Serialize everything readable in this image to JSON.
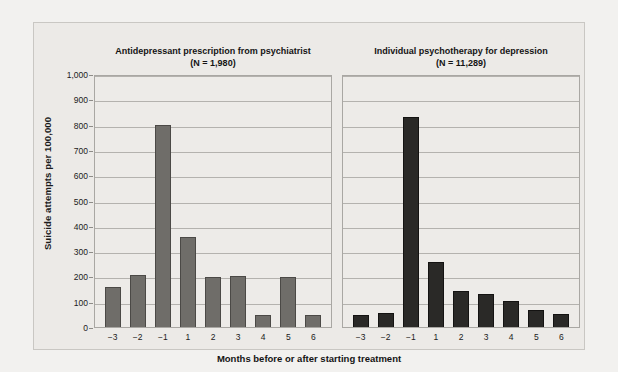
{
  "figure": {
    "y_axis_title": "Suicide attempts per 100,000",
    "x_axis_title": "Months before or after starting treatment"
  },
  "chart_data": [
    {
      "type": "bar",
      "title": "Antidepressant prescription from psychiatrist",
      "subtitle": "(N = 1,980)",
      "xlabel": "Months before or after starting treatment",
      "ylabel": "Suicide attempts per 100,000",
      "ylim": [
        0,
        1000
      ],
      "yticks": [
        "0",
        "100",
        "200",
        "300",
        "400",
        "500",
        "600",
        "700",
        "800",
        "900",
        "1,000"
      ],
      "grid": true,
      "legend": "none",
      "bar_color": "#6f6d69",
      "categories": [
        "−3",
        "−2",
        "−1",
        "1",
        "2",
        "3",
        "4",
        "5",
        "6"
      ],
      "values": [
        155,
        200,
        795,
        352,
        195,
        197,
        45,
        195,
        45
      ]
    },
    {
      "type": "bar",
      "title": "Individual psychotherapy for depression",
      "subtitle": "(N = 11,289)",
      "xlabel": "Months before or after starting treatment",
      "ylabel": "Suicide attempts per 100,000",
      "ylim": [
        0,
        1000
      ],
      "yticks": [
        "0",
        "100",
        "200",
        "300",
        "400",
        "500",
        "600",
        "700",
        "800",
        "900",
        "1,000"
      ],
      "grid": true,
      "legend": "none",
      "bar_color": "#2a2927",
      "categories": [
        "−3",
        "−2",
        "−1",
        "1",
        "2",
        "3",
        "4",
        "5",
        "6"
      ],
      "values": [
        42,
        50,
        825,
        255,
        140,
        126,
        100,
        65,
        48
      ]
    }
  ]
}
